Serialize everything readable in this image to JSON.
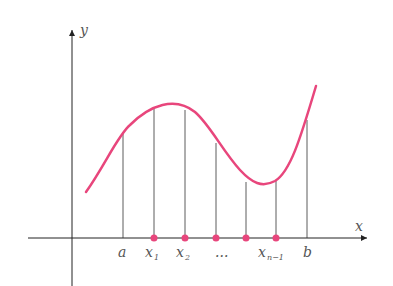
{
  "diagram": {
    "axes": {
      "x_label": "x",
      "y_label": "y"
    },
    "tick_labels": [
      "a",
      "x",
      "x",
      "...",
      "x",
      "b"
    ],
    "subscripts": {
      "x1": "1",
      "x2": "2",
      "xn1": "n−1"
    },
    "colors": {
      "curve": "#e8467c",
      "axis": "#222222",
      "lines": "#333333"
    }
  }
}
